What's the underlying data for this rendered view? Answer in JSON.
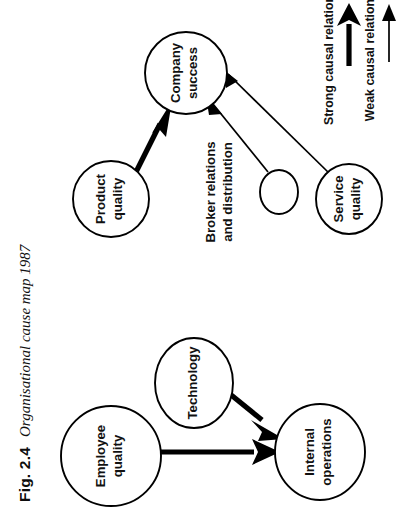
{
  "page": {
    "orientation": "rotated-90-ccw",
    "background_color": "#ffffff",
    "ink_color": "#111111"
  },
  "caption": {
    "figure_number": "Fig. 2.4",
    "title": "Organisational cause map 1987"
  },
  "diagram": {
    "type": "cause-map",
    "nodes": [
      {
        "id": "company-success",
        "label_line1": "Company",
        "label_line2": "success",
        "cx": 186,
        "cy": 73,
        "rx": 41,
        "ry": 41,
        "empty": false
      },
      {
        "id": "product-quality",
        "label_line1": "Product",
        "label_line2": "quality",
        "cx": 111,
        "cy": 199,
        "rx": 38,
        "ry": 38,
        "empty": false
      },
      {
        "id": "unnamed-node",
        "label_line1": "",
        "label_line2": "",
        "cx": 279,
        "cy": 192,
        "rx": 19,
        "ry": 22,
        "empty": true
      },
      {
        "id": "service-quality",
        "label_line1": "Service",
        "label_line2": "quality",
        "cx": 349,
        "cy": 199,
        "rx": 33,
        "ry": 35,
        "empty": false
      },
      {
        "id": "employee-quality",
        "label_line1": "Employee",
        "label_line2": "quality",
        "cx": 111,
        "cy": 456,
        "rx": 50,
        "ry": 50,
        "empty": false
      },
      {
        "id": "technology",
        "label_line1": "Technology",
        "label_line2": "",
        "cx": 194,
        "cy": 383,
        "rx": 39,
        "ry": 45,
        "empty": false
      },
      {
        "id": "internal-operations",
        "label_line1": "Internal",
        "label_line2": "operations",
        "cx": 320,
        "cy": 452,
        "rx": 45,
        "ry": 48,
        "empty": false
      }
    ],
    "free_labels": [
      {
        "id": "broker-relations",
        "line1": "Broker relations",
        "line2": "and distribution",
        "x": 221,
        "y": 192
      }
    ],
    "edges": [
      {
        "id": "product-to-success",
        "from": "product-quality",
        "to": "company-success",
        "strength": "strong"
      },
      {
        "id": "unnamed-to-success",
        "from": "unnamed-node",
        "to": "company-success",
        "strength": "weak"
      },
      {
        "id": "service-to-success",
        "from": "service-quality",
        "to": "company-success",
        "strength": "weak"
      },
      {
        "id": "employee-to-internal",
        "from": "employee-quality",
        "to": "internal-operations",
        "strength": "strong"
      },
      {
        "id": "technology-to-internal",
        "from": "technology",
        "to": "internal-operations",
        "strength": "strong"
      }
    ]
  },
  "legend": {
    "items": [
      {
        "id": "strong-causal-relation",
        "label": "Strong causal relation",
        "strength": "strong"
      },
      {
        "id": "weak-causal-relation",
        "label": "Weak causal relation",
        "strength": "weak"
      }
    ]
  }
}
